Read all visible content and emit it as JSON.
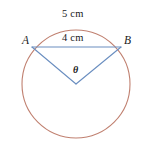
{
  "figure": {
    "background_color": "#ffffff",
    "width": 148,
    "height": 155
  },
  "circle": {
    "name": "circle",
    "center_x": 76,
    "center_y": 84,
    "radius": 54,
    "stroke_color": "#c08070",
    "stroke_width": 1.1,
    "fill": "none"
  },
  "points": {
    "a": {
      "label": "A",
      "x": 32,
      "y": 47
    },
    "b": {
      "label": "B",
      "x": 121,
      "y": 47
    },
    "center": {
      "label": "",
      "x": 76,
      "y": 84
    }
  },
  "segments": {
    "stroke_color": "#6a8ec0",
    "stroke_width": 1.1,
    "chord": {
      "name": "chord-ab",
      "x1": 32,
      "y1": 47,
      "x2": 121,
      "y2": 47
    },
    "radius_a": {
      "name": "radius-to-a",
      "x1": 76,
      "y1": 84,
      "x2": 32,
      "y2": 47
    },
    "radius_b": {
      "name": "radius-to-b",
      "x1": 76,
      "y1": 84,
      "x2": 121,
      "y2": 47
    }
  },
  "labels": {
    "arc_length": "5 cm",
    "chord_length": "4 cm",
    "angle": "θ",
    "text_color": "#1a1a1a"
  }
}
